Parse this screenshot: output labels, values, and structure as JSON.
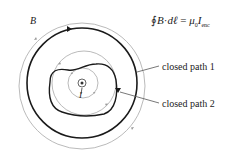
{
  "diagram": {
    "field_label": "B",
    "current_label": "I",
    "formula": {
      "integral": "∮",
      "lhs_B": "B",
      "dot": "·",
      "lhs_dl": "dℓ",
      "equals": "=",
      "mu": "μ",
      "mu_sub": "0",
      "I": "I",
      "I_sub": "enc"
    },
    "labels": {
      "path1": "closed path 1",
      "path2": "closed path 2"
    },
    "colors": {
      "path": "#1a1a1a",
      "field_line": "#a0a0a0",
      "text": "#222222"
    }
  }
}
